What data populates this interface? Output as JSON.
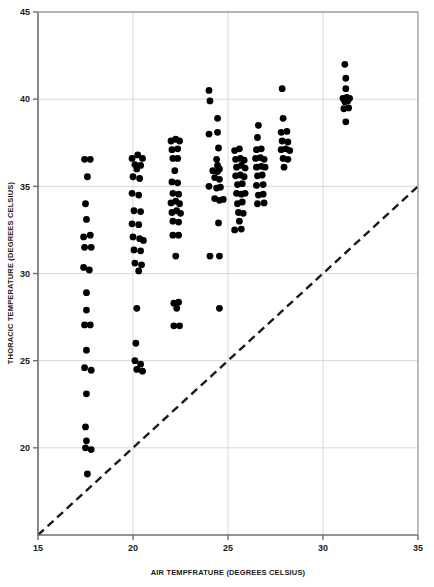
{
  "chart_data": {
    "type": "scatter",
    "title": "",
    "xlabel": "AIR TEMPFRATURE (DEGREES CELSIUS)",
    "ylabel": "THORACIC TEMPERATURE (DEGREES CELSIUS)",
    "xlim": [
      15,
      35
    ],
    "ylim": [
      15,
      45
    ],
    "xticks": [
      15,
      20,
      25,
      30,
      35
    ],
    "yticks": [
      20,
      25,
      30,
      35,
      40,
      45
    ],
    "xtick_labels": [
      "15",
      "20",
      "25",
      "30",
      "35"
    ],
    "ytick_labels": [
      "20",
      "25",
      "30",
      "35",
      "40",
      "45"
    ],
    "grid": true,
    "grid_color": "#d8d8d8",
    "marker_color": "#000000",
    "marker_size": 4.4,
    "legend": null,
    "annotations": [
      {
        "type": "reference-line",
        "label": "isothermal line (y = x)",
        "style": "dashed",
        "color": "#1a1a1a",
        "from": [
          15,
          15
        ],
        "to": [
          35,
          35
        ]
      }
    ],
    "series": [
      {
        "name": "Thoracic temperature vs air temperature",
        "points": [
          [
            17.45,
            36.55
          ],
          [
            17.75,
            36.55
          ],
          [
            17.6,
            35.55
          ],
          [
            17.5,
            34.0
          ],
          [
            17.55,
            33.1
          ],
          [
            17.4,
            32.1
          ],
          [
            17.75,
            32.2
          ],
          [
            17.45,
            31.5
          ],
          [
            17.8,
            31.5
          ],
          [
            17.4,
            30.35
          ],
          [
            17.7,
            30.2
          ],
          [
            17.55,
            28.9
          ],
          [
            17.55,
            27.9
          ],
          [
            17.45,
            27.05
          ],
          [
            17.75,
            27.05
          ],
          [
            17.55,
            25.6
          ],
          [
            17.45,
            24.6
          ],
          [
            17.8,
            24.45
          ],
          [
            17.55,
            23.1
          ],
          [
            17.5,
            21.2
          ],
          [
            17.55,
            20.4
          ],
          [
            17.5,
            20.0
          ],
          [
            17.8,
            19.9
          ],
          [
            17.6,
            18.5
          ],
          [
            19.95,
            36.6
          ],
          [
            20.25,
            36.8
          ],
          [
            20.5,
            36.6
          ],
          [
            20.1,
            36.25
          ],
          [
            20.4,
            36.2
          ],
          [
            20.2,
            36.0
          ],
          [
            20.0,
            35.55
          ],
          [
            20.35,
            35.45
          ],
          [
            19.95,
            34.6
          ],
          [
            20.3,
            34.5
          ],
          [
            20.05,
            33.6
          ],
          [
            20.4,
            33.55
          ],
          [
            19.95,
            32.85
          ],
          [
            20.3,
            32.8
          ],
          [
            20.0,
            32.1
          ],
          [
            20.35,
            32.0
          ],
          [
            20.55,
            31.9
          ],
          [
            20.05,
            31.35
          ],
          [
            20.4,
            31.3
          ],
          [
            20.1,
            30.6
          ],
          [
            20.45,
            30.5
          ],
          [
            20.3,
            30.15
          ],
          [
            20.2,
            28.0
          ],
          [
            20.15,
            26.0
          ],
          [
            20.1,
            25.0
          ],
          [
            20.4,
            24.8
          ],
          [
            20.2,
            24.5
          ],
          [
            20.5,
            24.4
          ],
          [
            22.0,
            37.6
          ],
          [
            22.25,
            37.7
          ],
          [
            22.45,
            37.6
          ],
          [
            22.05,
            37.1
          ],
          [
            22.35,
            37.15
          ],
          [
            22.1,
            36.6
          ],
          [
            22.35,
            36.6
          ],
          [
            22.2,
            35.9
          ],
          [
            22.05,
            35.25
          ],
          [
            22.35,
            35.2
          ],
          [
            22.1,
            34.6
          ],
          [
            22.4,
            34.55
          ],
          [
            22.0,
            34.05
          ],
          [
            22.25,
            34.15
          ],
          [
            22.45,
            34.0
          ],
          [
            22.05,
            33.5
          ],
          [
            22.3,
            33.6
          ],
          [
            22.5,
            33.45
          ],
          [
            22.1,
            33.0
          ],
          [
            22.4,
            32.95
          ],
          [
            22.1,
            32.2
          ],
          [
            22.4,
            32.2
          ],
          [
            22.25,
            31.0
          ],
          [
            22.15,
            28.3
          ],
          [
            22.4,
            28.35
          ],
          [
            22.3,
            28.0
          ],
          [
            22.15,
            27.0
          ],
          [
            22.45,
            27.0
          ],
          [
            24.0,
            40.5
          ],
          [
            24.05,
            39.9
          ],
          [
            24.45,
            38.9
          ],
          [
            24.0,
            38.0
          ],
          [
            24.45,
            38.1
          ],
          [
            24.5,
            37.2
          ],
          [
            24.4,
            36.55
          ],
          [
            24.45,
            36.2
          ],
          [
            24.2,
            35.9
          ],
          [
            24.45,
            35.85
          ],
          [
            24.55,
            36.0
          ],
          [
            24.3,
            35.5
          ],
          [
            24.55,
            35.4
          ],
          [
            24.4,
            34.9
          ],
          [
            24.6,
            34.95
          ],
          [
            24.3,
            34.3
          ],
          [
            24.55,
            34.2
          ],
          [
            24.75,
            34.25
          ],
          [
            24.0,
            35.0
          ],
          [
            24.5,
            32.9
          ],
          [
            24.55,
            31.0
          ],
          [
            24.05,
            31.0
          ],
          [
            24.55,
            28.0
          ],
          [
            25.35,
            37.05
          ],
          [
            25.6,
            37.15
          ],
          [
            25.4,
            36.55
          ],
          [
            25.65,
            36.6
          ],
          [
            25.85,
            36.5
          ],
          [
            25.45,
            36.1
          ],
          [
            25.7,
            36.2
          ],
          [
            25.9,
            36.05
          ],
          [
            25.4,
            35.6
          ],
          [
            25.65,
            35.65
          ],
          [
            25.85,
            35.55
          ],
          [
            25.5,
            35.1
          ],
          [
            25.75,
            35.15
          ],
          [
            25.45,
            34.6
          ],
          [
            25.7,
            34.55
          ],
          [
            25.9,
            34.6
          ],
          [
            25.5,
            34.0
          ],
          [
            25.75,
            34.1
          ],
          [
            25.55,
            33.5
          ],
          [
            25.8,
            33.45
          ],
          [
            25.6,
            33.0
          ],
          [
            25.35,
            32.5
          ],
          [
            25.7,
            32.55
          ],
          [
            26.6,
            38.5
          ],
          [
            26.55,
            37.8
          ],
          [
            26.5,
            37.1
          ],
          [
            26.75,
            37.15
          ],
          [
            26.45,
            36.6
          ],
          [
            26.7,
            36.65
          ],
          [
            26.9,
            36.55
          ],
          [
            26.5,
            36.1
          ],
          [
            26.75,
            36.15
          ],
          [
            26.95,
            36.1
          ],
          [
            26.55,
            35.6
          ],
          [
            26.8,
            35.65
          ],
          [
            26.5,
            35.05
          ],
          [
            26.85,
            35.1
          ],
          [
            26.6,
            34.5
          ],
          [
            26.85,
            34.55
          ],
          [
            26.55,
            34.0
          ],
          [
            26.9,
            34.05
          ],
          [
            27.85,
            40.6
          ],
          [
            27.9,
            38.9
          ],
          [
            27.8,
            38.1
          ],
          [
            28.1,
            38.15
          ],
          [
            27.85,
            37.6
          ],
          [
            28.15,
            37.55
          ],
          [
            27.8,
            37.1
          ],
          [
            28.05,
            37.15
          ],
          [
            28.25,
            37.05
          ],
          [
            27.9,
            36.6
          ],
          [
            28.15,
            36.55
          ],
          [
            27.95,
            36.1
          ],
          [
            31.15,
            42.0
          ],
          [
            31.2,
            41.2
          ],
          [
            31.2,
            40.6
          ],
          [
            31.05,
            40.05
          ],
          [
            31.25,
            40.1
          ],
          [
            31.4,
            40.05
          ],
          [
            31.15,
            39.85
          ],
          [
            31.3,
            39.9
          ],
          [
            31.1,
            39.45
          ],
          [
            31.35,
            39.5
          ],
          [
            31.2,
            38.7
          ]
        ]
      }
    ]
  }
}
